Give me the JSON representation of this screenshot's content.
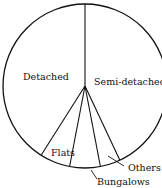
{
  "chart_data": {
    "type": "pie",
    "title": "",
    "start_angle_deg": 0,
    "direction": "clockwise",
    "categories": [
      "Semi-detached",
      "Others",
      "Bungalows",
      "Flats",
      "Detached"
    ],
    "values": [
      43,
      4,
      6,
      6,
      41
    ],
    "unit": "%",
    "labels": {
      "detached": "Detached",
      "semi_detached": "Semi-detached",
      "flats": "Flats",
      "bungalows": "Bungalows",
      "others": "Others"
    },
    "legend": "none (labels placed on/near slices, leader lines for Bungalows and Others)",
    "colors": {
      "fill": "#ffffff",
      "stroke": "#111111"
    }
  }
}
